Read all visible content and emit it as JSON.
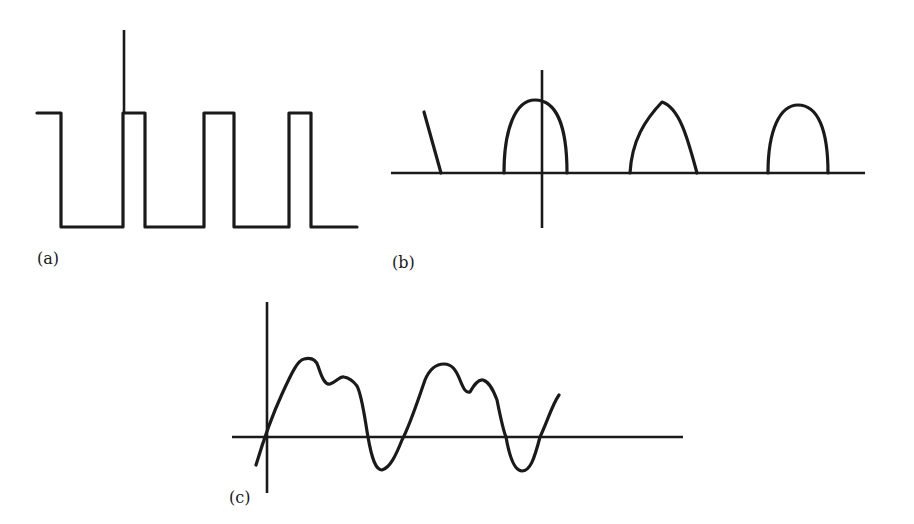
{
  "figure": {
    "panels": [
      {
        "id": "a",
        "label": "(a)",
        "description": "Rectangular pulse train with vertical axis",
        "stroke_color": "#1a1a1a"
      },
      {
        "id": "b",
        "label": "(b)",
        "description": "Half-wave rectified pulses (rounded arches) on baseline with vertical axis",
        "stroke_color": "#1a1a1a"
      },
      {
        "id": "c",
        "label": "(c)",
        "description": "Distorted periodic waveform with harmonic ripples crossing baseline",
        "stroke_color": "#1a1a1a"
      }
    ]
  }
}
